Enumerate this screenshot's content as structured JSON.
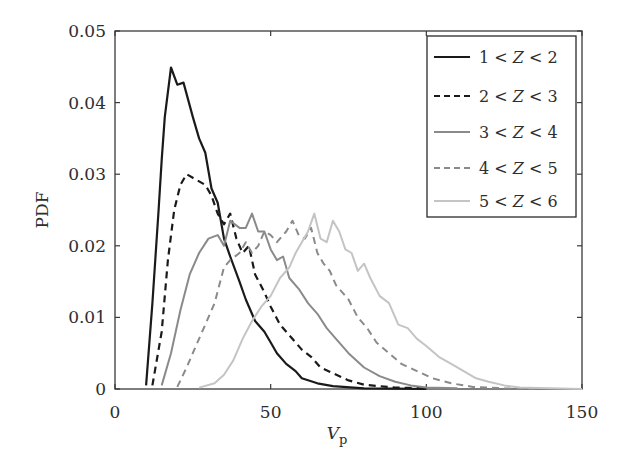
{
  "chart_data": {
    "type": "line",
    "title": "",
    "xlabel": "V",
    "xlabel_subscript": "p",
    "ylabel": "PDF",
    "xlim": [
      0,
      150
    ],
    "ylim": [
      0,
      0.05
    ],
    "grid": false,
    "legend_position": "upper right",
    "x_ticks": [
      0,
      50,
      100,
      150
    ],
    "x_tick_labels": [
      "0",
      "50",
      "100",
      "150"
    ],
    "y_ticks": [
      0,
      0.01,
      0.02,
      0.03,
      0.04,
      0.05
    ],
    "y_tick_labels": [
      "0",
      "0.01",
      "0.02",
      "0.03",
      "0.04",
      "0.05"
    ],
    "series": [
      {
        "name": "1 < Z < 2",
        "color": "#1a1a1a",
        "dash": "solid",
        "width": 2.2,
        "x": [
          10,
          12,
          14,
          15,
          16,
          18,
          20,
          22,
          25,
          27,
          29,
          31,
          33,
          35,
          37,
          40,
          42,
          45,
          48,
          50,
          52,
          55,
          58,
          60,
          65,
          70,
          80,
          90,
          100
        ],
        "y": [
          0.0005,
          0.012,
          0.025,
          0.032,
          0.038,
          0.0449,
          0.0425,
          0.0428,
          0.038,
          0.035,
          0.033,
          0.028,
          0.026,
          0.021,
          0.0185,
          0.015,
          0.0125,
          0.0095,
          0.008,
          0.0065,
          0.005,
          0.0035,
          0.0025,
          0.0015,
          0.0008,
          0.0004,
          0.0001,
          5e-05,
          0
        ]
      },
      {
        "name": "2 < Z < 3",
        "color": "#1a1a1a",
        "dash": "dashed",
        "width": 2.2,
        "x": [
          12,
          15,
          17,
          19,
          21,
          23,
          25,
          27,
          29,
          31,
          33,
          35,
          37,
          39,
          41,
          43,
          45,
          48,
          50,
          53,
          56,
          60,
          63,
          66,
          70,
          75,
          80,
          90,
          100
        ],
        "y": [
          0.0005,
          0.008,
          0.018,
          0.025,
          0.0285,
          0.03,
          0.0295,
          0.029,
          0.0285,
          0.027,
          0.0245,
          0.023,
          0.0245,
          0.021,
          0.019,
          0.02,
          0.016,
          0.0135,
          0.0115,
          0.009,
          0.0075,
          0.0055,
          0.0045,
          0.003,
          0.0022,
          0.0012,
          0.0006,
          0.0002,
          0.0001
        ]
      },
      {
        "name": "3 < Z < 4",
        "color": "#8a8a8a",
        "dash": "solid",
        "width": 2.0,
        "x": [
          15,
          18,
          21,
          24,
          27,
          30,
          33,
          35,
          37,
          40,
          42,
          44,
          46,
          48,
          50,
          52,
          54,
          56,
          59,
          62,
          65,
          68,
          71,
          75,
          80,
          85,
          90,
          95,
          100,
          110
        ],
        "y": [
          0.0005,
          0.005,
          0.011,
          0.016,
          0.019,
          0.021,
          0.0215,
          0.02,
          0.0235,
          0.0225,
          0.0225,
          0.0245,
          0.022,
          0.022,
          0.0195,
          0.018,
          0.0185,
          0.0155,
          0.014,
          0.012,
          0.0105,
          0.0085,
          0.007,
          0.005,
          0.003,
          0.0018,
          0.001,
          0.0005,
          0.0002,
          0.0001
        ]
      },
      {
        "name": "4 < Z < 5",
        "color": "#8a8a8a",
        "dash": "dashed",
        "width": 2.0,
        "x": [
          20,
          23,
          26,
          29,
          32,
          35,
          37,
          40,
          42,
          44,
          46,
          48,
          50,
          52,
          55,
          57,
          59,
          61,
          63,
          65,
          67,
          69,
          71,
          73,
          75,
          78,
          81,
          84,
          88,
          92,
          97,
          102,
          108,
          115,
          125,
          135
        ],
        "y": [
          0.0003,
          0.003,
          0.006,
          0.009,
          0.012,
          0.017,
          0.018,
          0.019,
          0.0205,
          0.019,
          0.02,
          0.022,
          0.0215,
          0.0205,
          0.022,
          0.0235,
          0.0215,
          0.021,
          0.0225,
          0.019,
          0.0175,
          0.0165,
          0.0145,
          0.0135,
          0.0125,
          0.01,
          0.0085,
          0.0065,
          0.005,
          0.0035,
          0.0025,
          0.0015,
          0.0008,
          0.0003,
          0.0001,
          0
        ]
      },
      {
        "name": "5 < Z < 6",
        "color": "#c4c4c4",
        "dash": "solid",
        "width": 2.0,
        "x": [
          27,
          32,
          35,
          38,
          41,
          44,
          47,
          50,
          53,
          56,
          58,
          60,
          62,
          64,
          66,
          68,
          70,
          72,
          74,
          76,
          78,
          80,
          82,
          85,
          88,
          91,
          94,
          97,
          100,
          104,
          108,
          112,
          116,
          120,
          125,
          130,
          140,
          150
        ],
        "y": [
          0.0002,
          0.0008,
          0.002,
          0.004,
          0.007,
          0.0095,
          0.0115,
          0.013,
          0.0155,
          0.017,
          0.019,
          0.0205,
          0.022,
          0.0245,
          0.021,
          0.0205,
          0.0235,
          0.022,
          0.0195,
          0.019,
          0.0165,
          0.0175,
          0.0155,
          0.013,
          0.012,
          0.009,
          0.0085,
          0.007,
          0.006,
          0.0045,
          0.0035,
          0.0025,
          0.0015,
          0.001,
          0.0005,
          0.0002,
          0.0001,
          0
        ]
      }
    ]
  },
  "axes": {
    "x_label_main": "V",
    "x_label_sub": "p",
    "y_label": "PDF"
  },
  "legend": {
    "items": [
      {
        "pre": "1 < ",
        "var": "Z",
        "post": " < 2"
      },
      {
        "pre": "2 < ",
        "var": "Z",
        "post": " < 3"
      },
      {
        "pre": "3 < ",
        "var": "Z",
        "post": " < 4"
      },
      {
        "pre": "4 < ",
        "var": "Z",
        "post": " < 5"
      },
      {
        "pre": "5 < ",
        "var": "Z",
        "post": " < 6"
      }
    ]
  }
}
